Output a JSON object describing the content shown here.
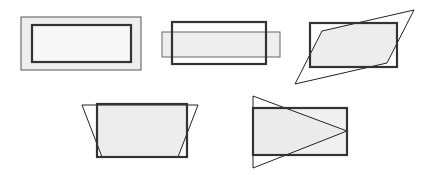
{
  "figure": {
    "title": "",
    "width": 431,
    "height": 175,
    "background_color": "#ffffff",
    "fill_color": "#eeeeee",
    "fill_color_light": "#f2f2f2",
    "thin_stroke_color": "#222222",
    "thick_stroke_color": "#333333",
    "thin_stroke_width": 1,
    "thick_stroke_width": 2.2,
    "shapes": [
      {
        "id": "shape-1",
        "label": "nested-rectangles",
        "description": "Light gray filled outer rectangle with a thin border containing a concentric white rectangle with a thick dark border",
        "outer_rect": {
          "x": 21,
          "y": 17,
          "width": 120,
          "height": 53
        },
        "inner_rect": {
          "x": 32,
          "y": 25,
          "width": 99,
          "height": 37
        }
      },
      {
        "id": "shape-2",
        "label": "overlapping-rectangles-horizontal",
        "description": "A short wide gray rectangle overlapping a taller thick-bordered rectangle, offset horizontally",
        "gray_rect": {
          "x": 162,
          "y": 32,
          "width": 118,
          "height": 25
        },
        "dark_rect": {
          "x": 172,
          "y": 22,
          "width": 94,
          "height": 42
        }
      },
      {
        "id": "shape-3",
        "label": "parallelogram-over-rectangle",
        "description": "A steeply slanted thin-outlined parallelogram crossing a thick-bordered rectangle; intersection shaded gray",
        "dark_rect": {
          "x": 310,
          "y": 23,
          "width": 87,
          "height": 44
        },
        "parallelogram_points": "295,84 322,31 414,10 387,63"
      },
      {
        "id": "shape-4",
        "label": "trapezoid-over-rectangle",
        "description": "A downward-narrowing trapezoid overlapping a thick-bordered rectangle; wider at the top",
        "dark_rect": {
          "x": 97,
          "y": 104,
          "width": 90,
          "height": 53
        },
        "trapezoid_points": "82,105 198,105 178,157 102,157"
      },
      {
        "id": "shape-5",
        "label": "triangle-over-rectangle",
        "description": "A right-pointing triangle overlapping a thick-bordered rectangle; apex touches the rectangle right edge",
        "dark_rect": {
          "x": 253,
          "y": 108,
          "width": 94,
          "height": 47
        },
        "triangle_points": "253,96 347,131 253,168"
      }
    ]
  }
}
